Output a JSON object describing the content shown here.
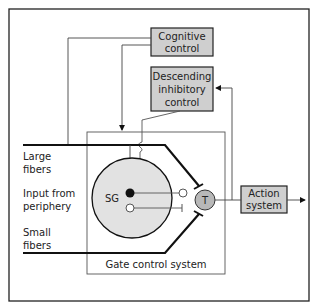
{
  "diagram": {
    "title": "Gate control system",
    "colors": {
      "box_fill": "#cfcfcf",
      "sg_fill": "#e2e2e2",
      "t_fill": "#b8b8b8",
      "line": "#111111",
      "thin_line": "#555555"
    },
    "boxes": {
      "cognitive": {
        "line1": "Cognitive",
        "line2": "control"
      },
      "descending": {
        "line1": "Descending",
        "line2": "inhibitory",
        "line3": "control"
      },
      "action": {
        "line1": "Action",
        "line2": "system"
      }
    },
    "nodes": {
      "sg": "SG",
      "t": "T"
    },
    "inputs": {
      "large_fibers": {
        "line1": "Large",
        "line2": "fibers"
      },
      "periphery": {
        "line1": "Input from",
        "line2": "periphery"
      },
      "small_fibers": {
        "line1": "Small",
        "line2": "fibers"
      }
    },
    "gate_label": "Gate control system"
  }
}
